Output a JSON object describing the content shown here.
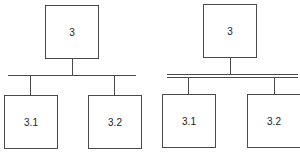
{
  "diagrams": [
    {
      "name": "single-bar-hierarchy",
      "connector": "single",
      "root": {
        "label": "3"
      },
      "children": [
        {
          "label": "3.1"
        },
        {
          "label": "3.2"
        }
      ]
    },
    {
      "name": "double-bar-hierarchy",
      "connector": "double",
      "root": {
        "label": "3"
      },
      "children": [
        {
          "label": "3.1"
        },
        {
          "label": "3.2"
        }
      ]
    }
  ],
  "colors": {
    "line": "#4a4a4a",
    "background": "#ffffff",
    "text": "#222222"
  }
}
